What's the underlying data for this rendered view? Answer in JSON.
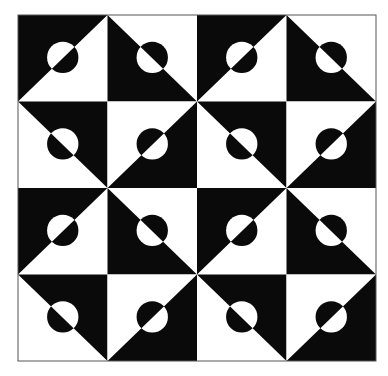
{
  "artwork": {
    "description": "Op-art tiling of 4x4 squares, each split diagonally into black and white triangles with a color-inverted circle centered on the diagonal",
    "colors": {
      "dark": "#0a0a0a",
      "light": "#ffffff",
      "border": "#555555"
    },
    "grid": {
      "rows": 4,
      "cols": 4,
      "x": 18,
      "y": 15,
      "width": 358,
      "height": 346
    },
    "circle": {
      "cx_frac": 0.5,
      "cy_frac": 0.49,
      "r_frac": 0.175
    },
    "tile_types": {
      "A": {
        "diagonal": "bl-tr",
        "dark_side": "top-left"
      },
      "B": {
        "diagonal": "tl-br",
        "dark_side": "bottom-left"
      },
      "C": {
        "diagonal": "tl-br",
        "dark_side": "top-right"
      },
      "D": {
        "diagonal": "bl-tr",
        "dark_side": "bottom-right"
      }
    },
    "layout": [
      [
        "A",
        "B",
        "A",
        "B"
      ],
      [
        "C",
        "D",
        "C",
        "D"
      ],
      [
        "A",
        "B",
        "A",
        "B"
      ],
      [
        "C",
        "D",
        "C",
        "D"
      ]
    ]
  }
}
